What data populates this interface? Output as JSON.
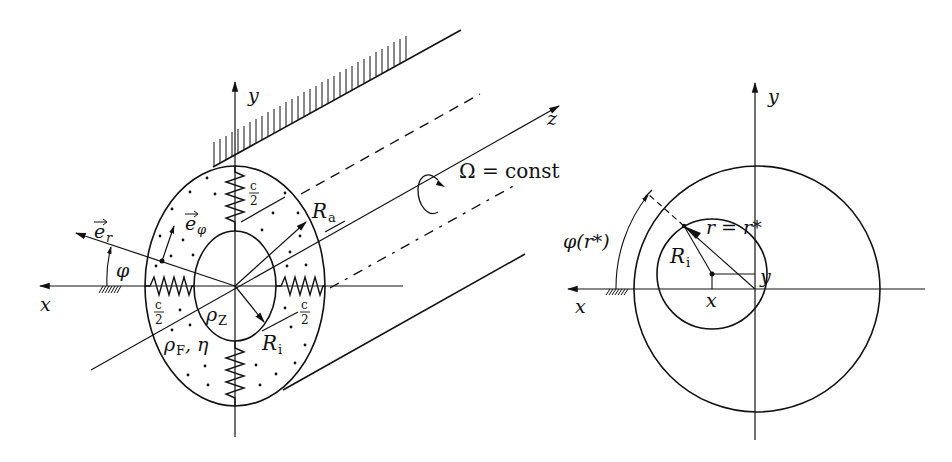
{
  "figure": {
    "left_panel": {
      "axis_labels": {
        "x": "x",
        "y": "y",
        "z": "z"
      },
      "rotation_label": "Ω = const",
      "vectors": {
        "e_r": "e",
        "e_r_sub": "r",
        "e_phi": "e",
        "e_phi_sub": "φ"
      },
      "angle_label": "φ",
      "radii": {
        "outer": "R",
        "outer_sub": "a",
        "inner": "R",
        "inner_sub": "i"
      },
      "spring_label_num": "c",
      "spring_label_den": "2",
      "rotor_density": "ρ",
      "rotor_density_sub": "Z",
      "fluid_props": "ρ",
      "fluid_props_sub": "F",
      "fluid_props_rest": ", η"
    },
    "right_panel": {
      "axis_labels": {
        "x": "x",
        "y": "y"
      },
      "angle_label": "φ(r*)",
      "radius_label": "r = r*",
      "inner_radius": "R",
      "inner_radius_sub": "i",
      "offset_x": "x",
      "offset_y": "y"
    },
    "colors": {
      "ink": "#111111",
      "background": "#ffffff"
    }
  }
}
